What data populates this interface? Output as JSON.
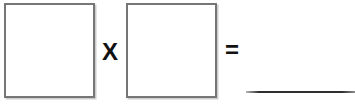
{
  "equation": {
    "factor1_value": "",
    "operator_label": "X",
    "factor2_value": "",
    "equals_label": "=",
    "answer_value": ""
  },
  "colors": {
    "background": "#ffffff",
    "box_border": "#767676",
    "box_shadow": "#cdcdcd",
    "symbol_text": "#111111",
    "answer_line": "#2f2f2f"
  }
}
